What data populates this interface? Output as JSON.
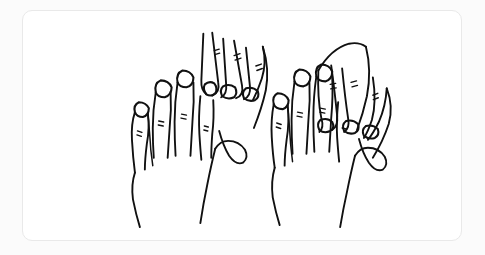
{
  "canvas": {
    "width": 485,
    "height": 255,
    "background_color": "#fbfbfb"
  },
  "card": {
    "name": "drawing-card",
    "background_color": "#ffffff",
    "border_color": "#e9e9e9",
    "corner_radius": 10,
    "x": 22,
    "y": 10,
    "width": 440,
    "height": 231
  },
  "artwork": {
    "title": "",
    "style": "line-drawing",
    "ink_color": "#111111",
    "subject": "two-pairs-of-interlocking-hands",
    "groups": [
      {
        "name": "left-hand-pair",
        "back_hand": {
          "name": "left-front-hand",
          "fingers": [
            {
              "name": "pinky-finger",
              "has_nail": true,
              "knuckle_marks": 2
            },
            {
              "name": "ring-finger",
              "has_nail": true,
              "knuckle_marks": 2
            },
            {
              "name": "middle-finger",
              "has_nail": true,
              "knuckle_marks": 2
            },
            {
              "name": "index-finger",
              "has_nail": false,
              "knuckle_marks": 1
            }
          ],
          "thumb": {
            "name": "thumb",
            "has_nail": false
          }
        },
        "interlocking_hand": {
          "name": "left-rear-hand",
          "fingers": [
            {
              "name": "angled-finger-1",
              "has_nail": true,
              "knuckle_marks": 2
            },
            {
              "name": "angled-finger-2",
              "has_nail": true,
              "knuckle_marks": 2
            },
            {
              "name": "angled-finger-3",
              "has_nail": true,
              "knuckle_marks": 2
            }
          ]
        }
      },
      {
        "name": "right-hand-pair",
        "back_hand": {
          "name": "right-front-hand",
          "fingers": [
            {
              "name": "pinky-finger",
              "has_nail": true,
              "knuckle_marks": 2
            },
            {
              "name": "ring-finger",
              "has_nail": true,
              "knuckle_marks": 2
            },
            {
              "name": "middle-finger",
              "has_nail": true,
              "knuckle_marks": 2
            },
            {
              "name": "index-finger",
              "has_nail": false,
              "knuckle_marks": 1
            }
          ],
          "thumb": {
            "name": "thumb",
            "has_nail": false
          }
        },
        "interlocking_hand": {
          "name": "right-rear-hand",
          "fingers": [
            {
              "name": "angled-finger-1",
              "has_nail": true,
              "knuckle_marks": 2
            },
            {
              "name": "angled-finger-2",
              "has_nail": true,
              "knuckle_marks": 2
            },
            {
              "name": "angled-finger-3",
              "has_nail": true,
              "knuckle_marks": 2
            }
          ]
        }
      }
    ]
  }
}
